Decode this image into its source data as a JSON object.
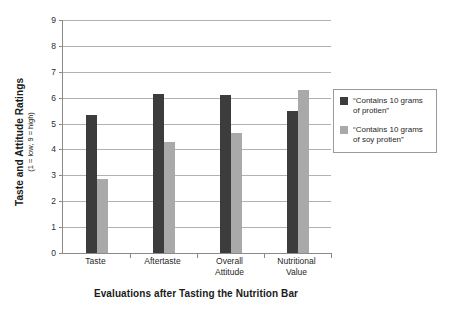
{
  "chart_data": {
    "type": "bar",
    "title": "",
    "xlabel": "Evaluations after Tasting the Nutrition Bar",
    "ylabel": "Taste and Attitude Ratings",
    "ylabel_sub": "(1 = low, 9 = high)",
    "categories": [
      "Taste",
      "Aftertaste",
      "Overall\nAttitude",
      "Nutritional\nValue"
    ],
    "category_lines": [
      [
        "Taste"
      ],
      [
        "Aftertaste"
      ],
      [
        "Overall",
        "Attitude"
      ],
      [
        "Nutritional",
        "Value"
      ]
    ],
    "series": [
      {
        "name": "“Contains 10 grams of protien”",
        "legend_lines": [
          "“Contains 10 grams",
          "of protien”"
        ],
        "color": "#3c3c3c",
        "values": [
          5.35,
          6.15,
          6.1,
          5.5
        ]
      },
      {
        "name": "“Contains 10 grams of soy protien”",
        "legend_lines": [
          "“Contains 10 grams",
          "of soy protien”"
        ],
        "color": "#a9a9a9",
        "values": [
          2.85,
          4.3,
          4.65,
          6.3
        ]
      }
    ],
    "ylim": [
      0,
      9
    ],
    "yticks": [
      0,
      1,
      2,
      3,
      4,
      5,
      6,
      7,
      8,
      9
    ],
    "ytick_labels": [
      "0",
      "1",
      "2",
      "3",
      "4",
      "5",
      "6",
      "7",
      "8",
      "9"
    ],
    "grid": true,
    "legend_position": "right"
  }
}
